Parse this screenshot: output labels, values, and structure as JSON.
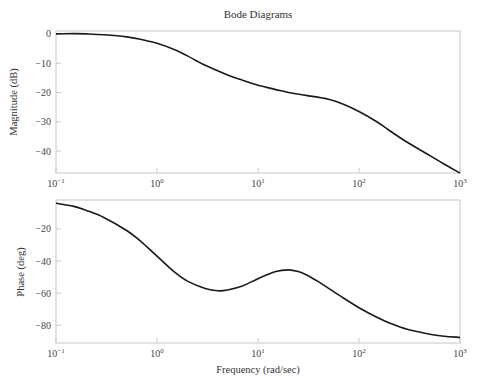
{
  "chart_data": {
    "type": "line",
    "title": "Bode Diagrams",
    "xlabel": "Frequency (rad/sec)",
    "xscale": "log",
    "xlim": [
      0.1,
      1000
    ],
    "x_tick_labels": [
      "10^-1",
      "10^0",
      "10^1",
      "10^2",
      "10^3"
    ],
    "grid": false,
    "subplots": [
      {
        "name": "magnitude",
        "ylabel": "Magnitude (dB)",
        "ylim": [
          -47.5,
          1
        ],
        "y_ticks": [
          0,
          -10,
          -20,
          -30,
          -40
        ],
        "x": [
          0.1,
          0.15,
          0.2,
          0.3,
          0.5,
          0.7,
          1,
          1.5,
          2,
          3,
          5,
          7,
          10,
          15,
          20,
          30,
          50,
          70,
          100,
          150,
          200,
          300,
          500,
          700,
          1000
        ],
        "values": [
          0,
          0.1,
          0,
          -0.3,
          -1,
          -1.9,
          -3.2,
          -5.4,
          -7.5,
          -10.7,
          -14,
          -15.8,
          -17.5,
          -19,
          -20,
          -21,
          -22.3,
          -24,
          -26.5,
          -30,
          -33,
          -37,
          -41.5,
          -44.5,
          -47.5
        ]
      },
      {
        "name": "phase",
        "ylabel": "Phase (deg)",
        "ylim": [
          -91,
          -2
        ],
        "y_ticks": [
          -20,
          -40,
          -60,
          -80
        ],
        "x": [
          0.1,
          0.15,
          0.2,
          0.3,
          0.5,
          0.7,
          1,
          1.5,
          2,
          3,
          4,
          5,
          7,
          10,
          15,
          20,
          25,
          30,
          40,
          50,
          70,
          100,
          150,
          200,
          300,
          500,
          700,
          1000
        ],
        "values": [
          -4,
          -6,
          -8.5,
          -13,
          -21,
          -28,
          -37,
          -47,
          -52.5,
          -57,
          -58.5,
          -58,
          -55.5,
          -51,
          -46.5,
          -45.5,
          -46.5,
          -48.5,
          -53,
          -57,
          -63,
          -69,
          -75,
          -78.5,
          -82.5,
          -85.5,
          -86.8,
          -87.5
        ]
      }
    ]
  }
}
